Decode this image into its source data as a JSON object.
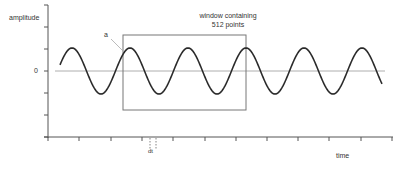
{
  "labels": {
    "y_axis": "amplitude",
    "zero": "0",
    "x_axis": "time",
    "window_line1": "window containing",
    "window_line2": "512 points",
    "marker_a": "a",
    "dt": "dt"
  },
  "colors": {
    "wave": "#2b2b2b",
    "axis": "#555555",
    "zero_line": "#999999",
    "window": "#777777"
  },
  "chart_data": {
    "type": "line",
    "title": "",
    "xlabel": "time",
    "ylabel": "amplitude",
    "series": [
      {
        "name": "sine wave",
        "function": "sinusoid",
        "cycles_visible": 5.6,
        "amplitude": 1
      }
    ],
    "annotations": [
      "window containing 512 points",
      "a",
      "dt"
    ],
    "grid": false
  }
}
